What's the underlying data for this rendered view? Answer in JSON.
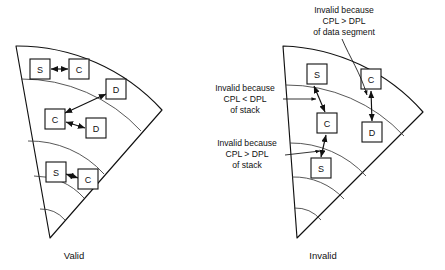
{
  "figure": {
    "type": "privilege-ring-diagram",
    "panels": [
      {
        "id": "valid",
        "caption": "Valid",
        "caption_x": 74,
        "caption_y": 256,
        "nodes": [
          {
            "label": "S",
            "x": 40,
            "y": 69
          },
          {
            "label": "C",
            "x": 79,
            "y": 69
          },
          {
            "label": "D",
            "x": 116,
            "y": 89
          },
          {
            "label": "C",
            "x": 55,
            "y": 119
          },
          {
            "label": "D",
            "x": 96,
            "y": 128
          },
          {
            "label": "S",
            "x": 56,
            "y": 172
          },
          {
            "label": "C",
            "x": 88,
            "y": 179
          }
        ],
        "arrows": [
          {
            "from": 0,
            "to": 1
          },
          {
            "from": 3,
            "to": 2
          },
          {
            "from": 3,
            "to": 4
          },
          {
            "from": 5,
            "to": 6
          }
        ]
      },
      {
        "id": "invalid",
        "caption": "Invalid",
        "caption_x": 323,
        "caption_y": 256,
        "nodes": [
          {
            "label": "S",
            "x": 317,
            "y": 74
          },
          {
            "label": "C",
            "x": 371,
            "y": 79
          },
          {
            "label": "C",
            "x": 327,
            "y": 123
          },
          {
            "label": "D",
            "x": 372,
            "y": 132
          },
          {
            "label": "S",
            "x": 321,
            "y": 168
          }
        ],
        "arrows": [
          {
            "from": 0,
            "to": 2
          },
          {
            "from": 1,
            "to": 3
          },
          {
            "from": 2,
            "to": 4
          }
        ]
      }
    ],
    "annotations": [
      {
        "id": "data-segment-violation",
        "lines": [
          "Invalid because",
          "CPL > DPL",
          "of data segment"
        ],
        "x": 344,
        "y": 13
      },
      {
        "id": "stack-cpl-less-violation",
        "lines": [
          "Invalid because",
          "CPL < DPL",
          "of stack"
        ],
        "x": 245,
        "y": 91
      },
      {
        "id": "stack-cpl-greater-violation",
        "lines": [
          "Invalid because",
          "CPL > DPL",
          "of stack"
        ],
        "x": 247,
        "y": 146
      }
    ],
    "node_glyph_meanings": {
      "S": "stack segment",
      "C": "code segment",
      "D": "data segment"
    },
    "colors": {
      "outline": "#111111",
      "divider": "#3a3a3a",
      "background": "#ffffff",
      "text": "#111111"
    }
  }
}
